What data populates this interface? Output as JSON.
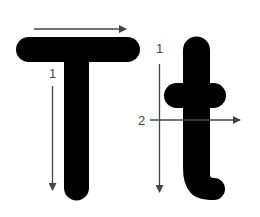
{
  "diagram": {
    "title": "",
    "letters": [
      {
        "glyph": "T",
        "case": "uppercase",
        "strokes": [
          {
            "order": 1,
            "label": "1",
            "direction": "down",
            "part": "stem"
          },
          {
            "order": null,
            "label": "",
            "direction": "right",
            "part": "crossbar"
          }
        ]
      },
      {
        "glyph": "t",
        "case": "lowercase",
        "strokes": [
          {
            "order": 1,
            "label": "1",
            "direction": "down",
            "part": "stem"
          },
          {
            "order": 2,
            "label": "2",
            "direction": "right",
            "part": "crossbar"
          }
        ]
      }
    ],
    "labels": {
      "upper_stem": "1",
      "lower_stem": "1",
      "lower_cross": "2"
    },
    "colors": {
      "glyph": "#000000",
      "arrow": "#444444",
      "background": "#ffffff"
    }
  }
}
